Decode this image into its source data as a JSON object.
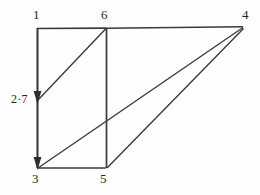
{
  "figure": {
    "stroke_color": "#3a3a3a",
    "background_color": "#fefefe",
    "labels": {
      "vertex_1": "1",
      "vertex_6": "6",
      "vertex_4": "4",
      "vertex_3": "3",
      "vertex_5": "5",
      "measure_2_7": "2·7"
    },
    "geometry": {
      "points": {
        "p1": [
          37,
          28
        ],
        "p6": [
          106,
          28
        ],
        "p4": [
          243,
          27
        ],
        "p3": [
          37,
          168
        ],
        "p5": [
          106,
          168
        ],
        "arrow_mid": [
          37,
          100
        ]
      },
      "edges": [
        {
          "name": "top-edge-1-6",
          "from": "p1",
          "to": "p6"
        },
        {
          "name": "top-edge-6-4",
          "from": "p6",
          "to": "p4"
        },
        {
          "name": "left-edge-1-3",
          "from": "p1",
          "to": "p3"
        },
        {
          "name": "bottom-edge-3-5",
          "from": "p3",
          "to": "p5"
        },
        {
          "name": "vertical-edge-6-5",
          "from": "p6",
          "to": "p5"
        },
        {
          "name": "diagonal-6-mid",
          "from": "p6",
          "to": "arrow_mid"
        },
        {
          "name": "diagonal-4-3",
          "from": "p4",
          "to": "p3"
        },
        {
          "name": "diagonal-4-5",
          "from": "p4",
          "to": "p5"
        }
      ],
      "arrowheads": [
        {
          "name": "arrowhead-mid",
          "at": [
            37,
            100
          ],
          "direction": "down"
        },
        {
          "name": "arrowhead-bottom",
          "at": [
            37,
            168
          ],
          "direction": "down"
        }
      ]
    }
  }
}
